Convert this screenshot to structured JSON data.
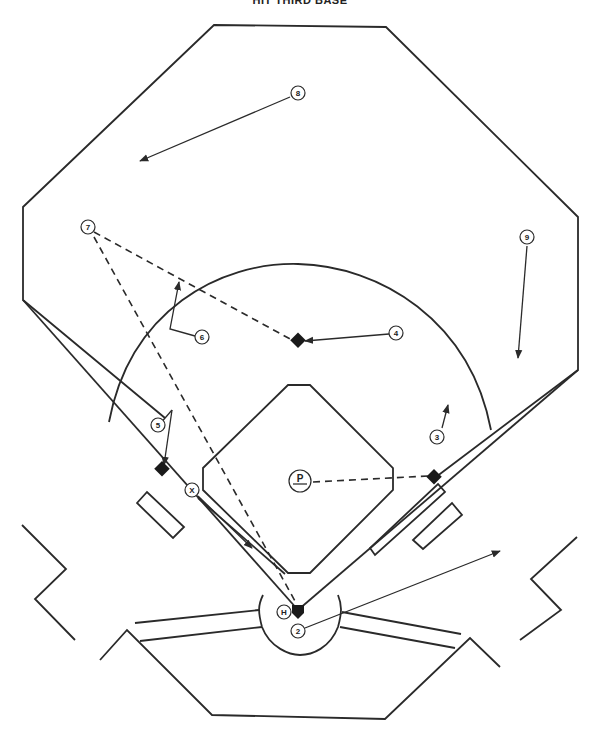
{
  "title": "HIT THIRD BASE",
  "diagram": {
    "type": "baseball-defensive-play",
    "players": [
      {
        "id": "8",
        "label": "8",
        "role": "center fielder"
      },
      {
        "id": "7",
        "label": "7",
        "role": "left fielder"
      },
      {
        "id": "9",
        "label": "9",
        "role": "right fielder"
      },
      {
        "id": "6",
        "label": "6",
        "role": "shortstop"
      },
      {
        "id": "4",
        "label": "4",
        "role": "second baseman"
      },
      {
        "id": "5",
        "label": "5",
        "role": "third baseman"
      },
      {
        "id": "3",
        "label": "3",
        "role": "first baseman"
      },
      {
        "id": "P",
        "label": "P",
        "role": "pitcher"
      },
      {
        "id": "X",
        "label": "X",
        "role": "batter-runner"
      },
      {
        "id": "H",
        "label": "H",
        "role": "home"
      },
      {
        "id": "2",
        "label": "2",
        "role": "catcher"
      }
    ],
    "bases": [
      "home-plate",
      "first-base",
      "second-base",
      "third-base"
    ],
    "throws_dashed": [
      {
        "from": "7",
        "to": "second-base"
      },
      {
        "from": "7",
        "to": "home-plate"
      },
      {
        "from": "P",
        "to": "first-base"
      }
    ],
    "movements": [
      {
        "player": "8",
        "direction": "toward left-center"
      },
      {
        "player": "9",
        "direction": "toward foul line"
      },
      {
        "player": "6",
        "direction": "cutoff position"
      },
      {
        "player": "4",
        "direction": "to second base"
      },
      {
        "player": "5",
        "direction": "to third base"
      },
      {
        "player": "3",
        "direction": "toward infield"
      },
      {
        "player": "X",
        "direction": "down the line"
      },
      {
        "player": "2",
        "direction": "backup"
      }
    ]
  },
  "colors": {
    "line": "#2a2a2a",
    "base": "#1a1a1a",
    "background": "#ffffff"
  }
}
